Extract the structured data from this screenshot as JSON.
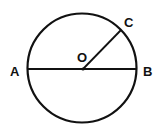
{
  "diagram": {
    "type": "circle-geometry",
    "stroke_color": "#111111",
    "background": "#ffffff",
    "circle": {
      "cx": 82,
      "cy": 68,
      "r": 55
    },
    "points": {
      "A": {
        "label": "A",
        "x": 27,
        "y": 69
      },
      "B": {
        "label": "B",
        "x": 137,
        "y": 69
      },
      "C": {
        "label": "C",
        "x": 121,
        "y": 30
      },
      "O": {
        "label": "O",
        "x": 83,
        "y": 69
      }
    },
    "segments": [
      {
        "name": "diameter-AB",
        "from": "A",
        "to": "B"
      },
      {
        "name": "radius-OC",
        "from": "O",
        "to": "C"
      }
    ]
  }
}
